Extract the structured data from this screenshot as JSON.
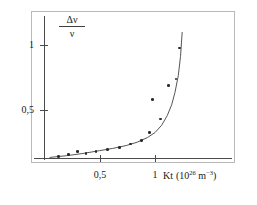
{
  "figure": {
    "background_color": "#ffffff",
    "frame_color": "#b9b9b9",
    "axis_color": "#4a4a4a",
    "point_color": "#2b2b2b",
    "curve_color": "#555555"
  },
  "axes": {
    "y_title_numerator": "Δν",
    "y_title_denominator": "ν",
    "x_title_symbol": "Kt",
    "x_title_units_open": "(10",
    "x_title_units_exp": "26",
    "x_title_units_mid": " m",
    "x_title_units_exp2": "−3",
    "x_title_units_close": ")",
    "y_ticks": [
      {
        "label": "1",
        "value": 1
      },
      {
        "label": "0,5",
        "value": 0.5
      }
    ],
    "x_ticks": [
      {
        "label": "0,5",
        "value": 0.5
      },
      {
        "label": "1",
        "value": 1
      }
    ]
  },
  "chart_data": {
    "type": "scatter",
    "title": "",
    "subtitle": "",
    "xlabel": "Kt (10^26 m^-3)",
    "ylabel": "Δν/ν",
    "xlim": [
      0,
      1.4
    ],
    "ylim": [
      0,
      1.2
    ],
    "grid": false,
    "legend": "none",
    "x_tick_labels": [
      "0,5",
      "1"
    ],
    "x_tick_values": [
      0.5,
      1.0
    ],
    "y_tick_labels": [
      "0,5",
      "1"
    ],
    "y_tick_values": [
      0.5,
      1.0
    ],
    "series": [
      {
        "name": "measured points",
        "marker": "dot",
        "x": [
          0.13,
          0.22,
          0.3,
          0.38,
          0.47,
          0.57,
          0.68,
          0.78,
          0.88,
          0.95,
          0.98,
          1.05,
          1.12,
          1.19,
          1.22
        ],
        "y": [
          0.015,
          0.03,
          0.055,
          0.04,
          0.06,
          0.075,
          0.095,
          0.125,
          0.155,
          0.225,
          0.52,
          0.345,
          0.64,
          0.7,
          0.975
        ]
      },
      {
        "name": "fitted curve",
        "marker": "line",
        "x": [
          0.05,
          0.2,
          0.35,
          0.5,
          0.62,
          0.74,
          0.84,
          0.93,
          1.0,
          1.06,
          1.11,
          1.15,
          1.18,
          1.21,
          1.23,
          1.245
        ],
        "y": [
          0.005,
          0.02,
          0.04,
          0.065,
          0.085,
          0.11,
          0.14,
          0.18,
          0.225,
          0.29,
          0.375,
          0.47,
          0.58,
          0.73,
          0.9,
          1.115
        ]
      }
    ],
    "annotations": []
  }
}
